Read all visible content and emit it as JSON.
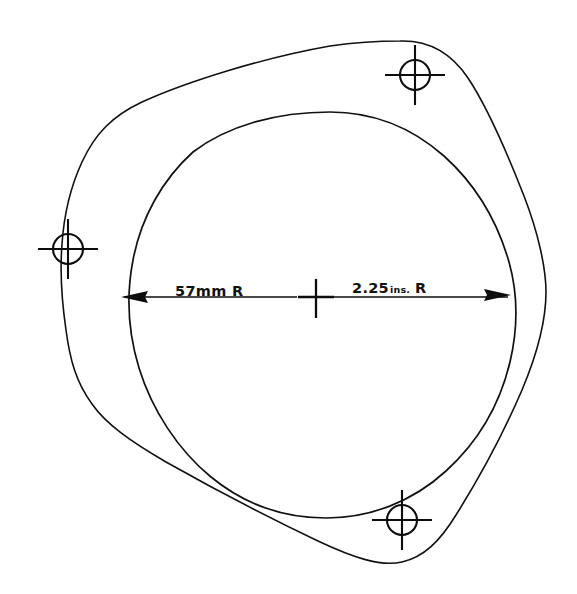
{
  "drawing": {
    "title": "Gasket Outline Technical Drawing",
    "background_color": "#ffffff",
    "line_color": "#111111",
    "dimensions": {
      "left_label": "57mm R",
      "right_label_value": "2.25",
      "right_label_unit": "ins.",
      "right_label_suffix": "R",
      "right_label_full": "2.25 ins. R"
    },
    "features": {
      "outer_outline_name": "rounded-triangular-flange-outline",
      "inner_outline_name": "circular-bore-opening",
      "bolt_hole_count": "3"
    },
    "bolt_holes": [
      {
        "id": "top-right",
        "cx": "415",
        "cy": "75",
        "r": "15"
      },
      {
        "id": "left",
        "cx": "68",
        "cy": "249",
        "r": "15"
      },
      {
        "id": "bottom-right",
        "cx": "402",
        "cy": "520",
        "r": "15"
      }
    ],
    "center_mark": {
      "cx": "316",
      "cy": "298"
    },
    "dimension_line": {
      "y": "297",
      "x_left": "122",
      "x_right": "510"
    }
  }
}
